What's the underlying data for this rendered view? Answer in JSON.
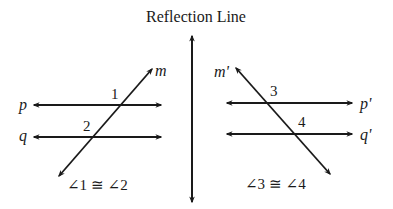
{
  "title": "Reflection Line",
  "left_figure": {
    "line_labels": {
      "transversal": "m",
      "top_parallel": "p",
      "bottom_parallel": "q"
    },
    "angle_labels": {
      "top": "1",
      "bottom": "2"
    },
    "statement": "∠1 ≅ ∠2"
  },
  "right_figure": {
    "line_labels": {
      "transversal": "m'",
      "top_parallel": "p'",
      "bottom_parallel": "q'"
    },
    "angle_labels": {
      "top": "3",
      "bottom": "4"
    },
    "statement": "∠3 ≅ ∠4"
  },
  "colors": {
    "stroke": "#1a1a1a",
    "background": "#ffffff"
  }
}
